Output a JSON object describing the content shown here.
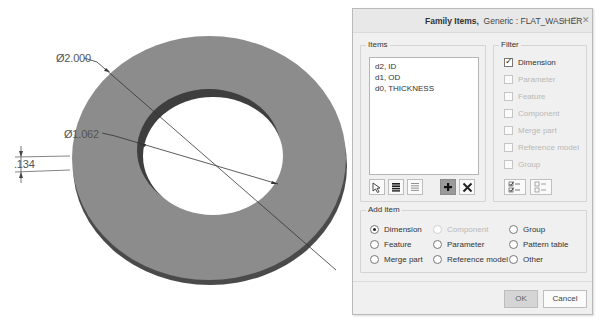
{
  "viewport": {
    "dimensions": [
      {
        "id": "outer_diameter",
        "label": "Ø2.000"
      },
      {
        "id": "inner_diameter",
        "label": "Ø1.062"
      },
      {
        "id": "thickness",
        "label": ".134"
      }
    ],
    "colors": {
      "top_face": "#8c8c8c",
      "side_face": "#4a4a4a",
      "hole_wall": "#3e3e3e",
      "background": "#ffffff"
    }
  },
  "dialog": {
    "title_bold": "Family Items,",
    "title_rest": "Generic : FLAT_WASHER",
    "window_controls": {
      "minimize": "–",
      "maximize": "□",
      "close": "✕"
    },
    "items_group": {
      "label": "Items",
      "list": [
        "d2, ID",
        "d1, OD",
        "d0, THICKNESS"
      ],
      "buttons": [
        {
          "name": "select-icon",
          "glyph": "pointer"
        },
        {
          "name": "select-all-icon",
          "glyph": "list-filled"
        },
        {
          "name": "deselect-all-icon",
          "glyph": "list-empty"
        },
        {
          "name": "add-icon",
          "glyph": "+"
        },
        {
          "name": "remove-icon",
          "glyph": "✕"
        }
      ]
    },
    "filter_group": {
      "label": "Filter",
      "options": [
        {
          "label": "Dimension",
          "checked": true,
          "enabled": true
        },
        {
          "label": "Parameter",
          "checked": false,
          "enabled": false
        },
        {
          "label": "Feature",
          "checked": false,
          "enabled": false
        },
        {
          "label": "Component",
          "checked": false,
          "enabled": false
        },
        {
          "label": "Merge part",
          "checked": false,
          "enabled": false
        },
        {
          "label": "Reference model",
          "checked": false,
          "enabled": false
        },
        {
          "label": "Group",
          "checked": false,
          "enabled": false
        }
      ]
    },
    "add_item_group": {
      "label": "Add item",
      "options": [
        {
          "label": "Dimension",
          "selected": true,
          "enabled": true
        },
        {
          "label": "Component",
          "selected": false,
          "enabled": false
        },
        {
          "label": "Group",
          "selected": false,
          "enabled": true
        },
        {
          "label": "Feature",
          "selected": false,
          "enabled": true
        },
        {
          "label": "Parameter",
          "selected": false,
          "enabled": true
        },
        {
          "label": "Pattern table",
          "selected": false,
          "enabled": true
        },
        {
          "label": "Merge part",
          "selected": false,
          "enabled": true
        },
        {
          "label": "Reference model",
          "selected": false,
          "enabled": true
        },
        {
          "label": "Other",
          "selected": false,
          "enabled": true
        }
      ]
    },
    "ok_label": "OK",
    "cancel_label": "Cancel"
  }
}
